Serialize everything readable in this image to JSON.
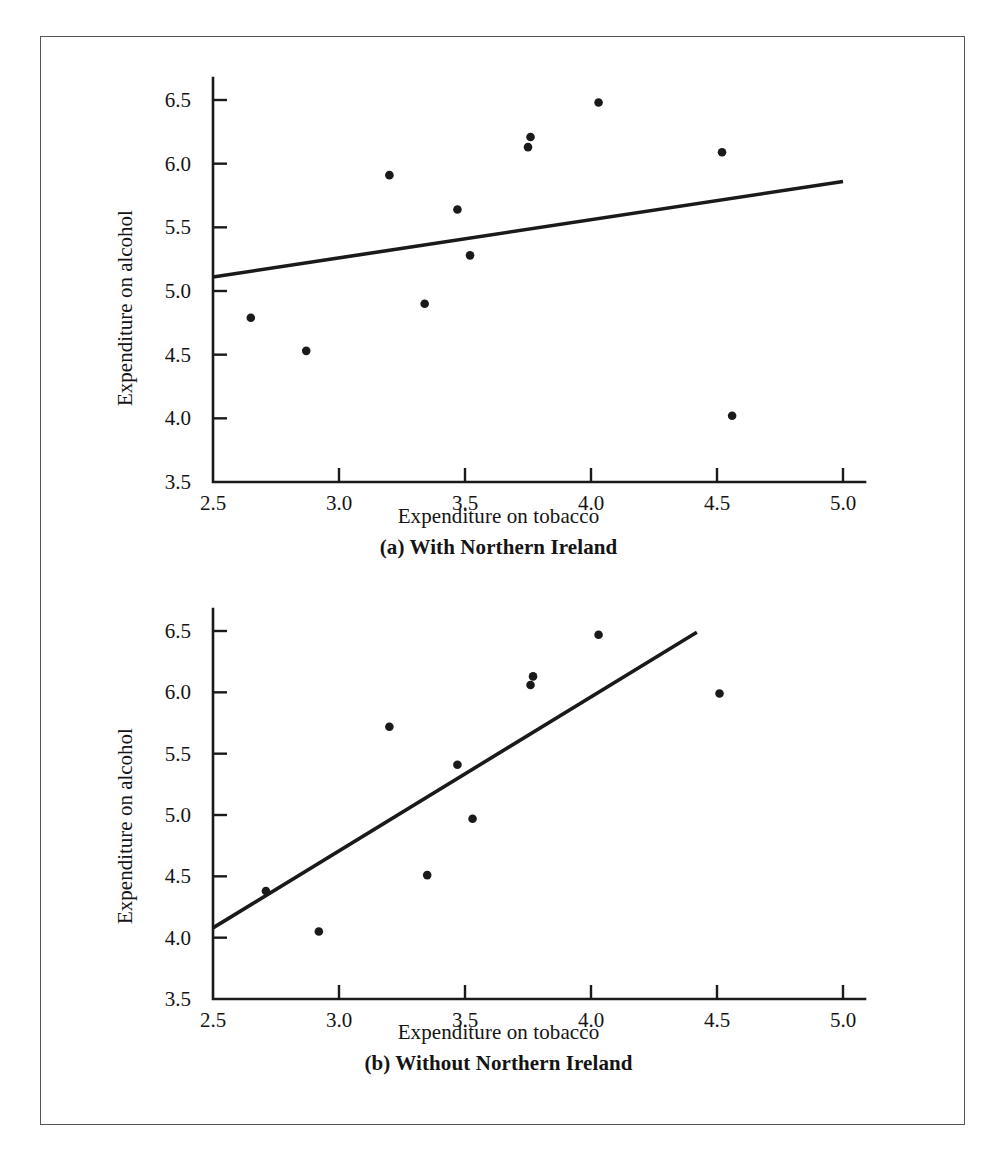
{
  "figure": {
    "border_color": "#55555b",
    "background": "#ffffff",
    "ink_color": "#1a1a1a"
  },
  "labels": {
    "y_axis_title": "Expenditure on alcohol",
    "x_axis_title": "Expenditure on tobacco",
    "caption_a": "(a) With Northern Ireland",
    "caption_b": "(b) Without Northern Ireland"
  },
  "chart_data": [
    {
      "type": "scatter",
      "panel": "a",
      "title": "(a) With Northern Ireland",
      "xlabel": "Expenditure on tobacco",
      "ylabel": "Expenditure on alcohol",
      "xlim": [
        2.5,
        5.0
      ],
      "ylim": [
        3.5,
        6.5
      ],
      "xticks": [
        "2.5",
        "3.0",
        "3.5",
        "4.0",
        "4.5",
        "5.0"
      ],
      "xtick_values": [
        2.5,
        3.0,
        3.5,
        4.0,
        4.5,
        5.0
      ],
      "yticks": [
        "3.5",
        "4.0",
        "4.5",
        "5.0",
        "5.5",
        "6.0",
        "6.5"
      ],
      "ytick_values": [
        3.5,
        4.0,
        4.5,
        5.0,
        5.5,
        6.0,
        6.5
      ],
      "grid": false,
      "legend": "none",
      "marker": "filled-circle",
      "marker_color": "#1a1a1a",
      "marker_size": 7,
      "points": [
        {
          "x": 2.65,
          "y": 4.79
        },
        {
          "x": 2.87,
          "y": 4.53
        },
        {
          "x": 3.2,
          "y": 5.91
        },
        {
          "x": 3.34,
          "y": 4.9
        },
        {
          "x": 3.47,
          "y": 5.64
        },
        {
          "x": 3.52,
          "y": 5.28
        },
        {
          "x": 3.75,
          "y": 6.13
        },
        {
          "x": 3.76,
          "y": 6.21
        },
        {
          "x": 4.03,
          "y": 6.48
        },
        {
          "x": 4.52,
          "y": 6.09
        },
        {
          "x": 4.56,
          "y": 4.02
        }
      ],
      "fit_line": {
        "kind": "least-squares",
        "color": "#1a1a1a",
        "width": 3.6,
        "x0": 2.5,
        "y0": 5.11,
        "x1": 5.0,
        "y1": 5.86
      }
    },
    {
      "type": "scatter",
      "panel": "b",
      "title": "(b) Without Northern Ireland",
      "xlabel": "Expenditure on tobacco",
      "ylabel": "Expenditure on alcohol",
      "xlim": [
        2.5,
        5.0
      ],
      "ylim": [
        3.5,
        6.5
      ],
      "xticks": [
        "2.5",
        "3.0",
        "3.5",
        "4.0",
        "4.5",
        "5.0"
      ],
      "xtick_values": [
        2.5,
        3.0,
        3.5,
        4.0,
        4.5,
        5.0
      ],
      "yticks": [
        "3.5",
        "4.0",
        "4.5",
        "5.0",
        "5.5",
        "6.0",
        "6.5"
      ],
      "ytick_values": [
        3.5,
        4.0,
        4.5,
        5.0,
        5.5,
        6.0,
        6.5
      ],
      "grid": false,
      "legend": "none",
      "marker": "filled-circle",
      "marker_color": "#1a1a1a",
      "marker_size": 7,
      "points": [
        {
          "x": 2.71,
          "y": 4.38
        },
        {
          "x": 2.92,
          "y": 4.05
        },
        {
          "x": 3.2,
          "y": 5.72
        },
        {
          "x": 3.35,
          "y": 4.51
        },
        {
          "x": 3.47,
          "y": 5.41
        },
        {
          "x": 3.53,
          "y": 4.97
        },
        {
          "x": 3.76,
          "y": 6.06
        },
        {
          "x": 3.77,
          "y": 6.13
        },
        {
          "x": 4.03,
          "y": 6.47
        },
        {
          "x": 4.51,
          "y": 5.99
        }
      ],
      "fit_line": {
        "kind": "least-squares",
        "color": "#1a1a1a",
        "width": 3.6,
        "x0": 2.5,
        "y0": 4.08,
        "x1": 4.42,
        "y1": 6.49
      }
    }
  ]
}
